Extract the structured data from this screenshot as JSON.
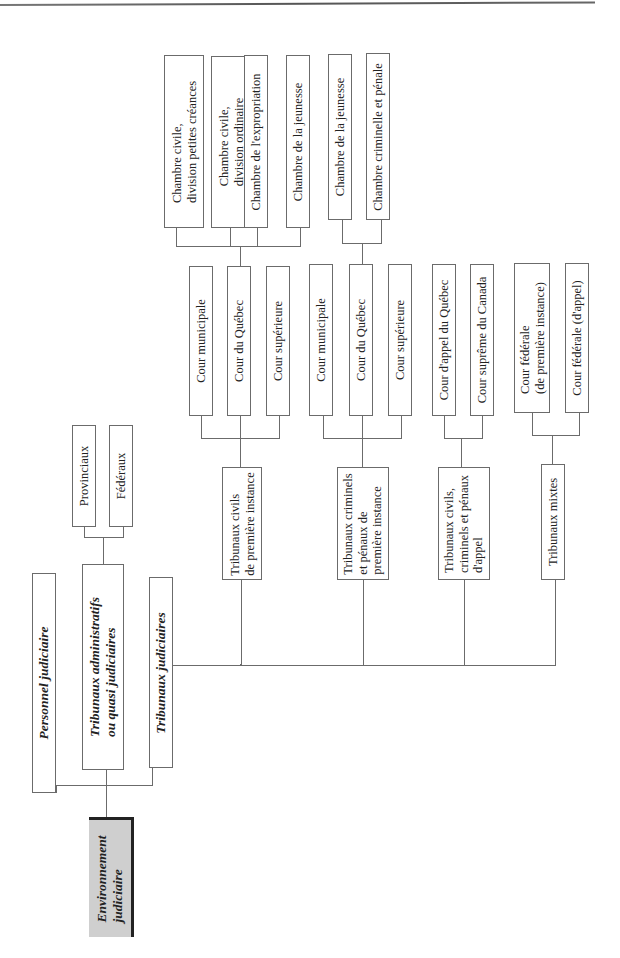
{
  "diagram": {
    "type": "org-tree",
    "orientation": "rotated-90-ccw",
    "root": {
      "label": "Environnement\njudiciaire",
      "fill": "#cfcfcf"
    },
    "level1": [
      {
        "label": "Personnel judiciaire"
      },
      {
        "label": "Tribunaux administratifs\nou quasi judiciaires"
      },
      {
        "label": "Tribunaux judiciaires"
      }
    ],
    "admin_children": [
      {
        "label": "Provinciaux"
      },
      {
        "label": "Fédéraux"
      }
    ],
    "judicial_children": [
      {
        "label": "Tribunaux civils\nde première instance"
      },
      {
        "label": "Tribunaux criminels\net pénaux de\npremière instance"
      },
      {
        "label": "Tribunaux civils,\ncriminels et pénaux\nd'appel"
      },
      {
        "label": "Tribunaux mixtes"
      }
    ],
    "civil_courts": [
      {
        "label": "Cour municipale"
      },
      {
        "label": "Cour du Québec"
      },
      {
        "label": "Cour supérieure"
      }
    ],
    "civil_chambers": [
      {
        "label": "Chambre civile,\ndivision petites créances"
      },
      {
        "label": "Chambre civile,\ndivision ordinaire"
      },
      {
        "label": "Chambre de l'expropriation"
      },
      {
        "label": "Chambre de la jeunesse"
      }
    ],
    "criminal_courts": [
      {
        "label": "Cour municipale"
      },
      {
        "label": "Cour du Québec"
      },
      {
        "label": "Cour supérieure"
      }
    ],
    "criminal_chambers": [
      {
        "label": "Chambre de la jeunesse"
      },
      {
        "label": "Chambre criminelle et pénale"
      }
    ],
    "appeal_courts": [
      {
        "label": "Cour d'appel du Québec"
      },
      {
        "label": "Cour suprême du Canada"
      }
    ],
    "mixed_courts": [
      {
        "label": "Cour fédérale\n(de première instance)"
      },
      {
        "label": "Cour fédérale (d'appel)"
      }
    ]
  }
}
